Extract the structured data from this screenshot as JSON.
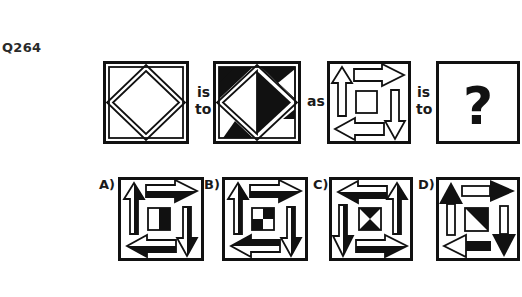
{
  "question": {
    "number": "Q264",
    "connectors": {
      "first_is": "is",
      "first_to": "to",
      "as": "as",
      "second_is": "is",
      "second_to": "to"
    },
    "figures": [
      {
        "id": "fig1",
        "description": "square frame with inscribed diamond, outlined, all white"
      },
      {
        "id": "fig2",
        "description": "square frame with inscribed diamond, left half white, right half black; corner triangles shaded black alternately"
      },
      {
        "id": "fig3",
        "description": "square frame with four outlined arrows circulating clockwise around a central square"
      },
      {
        "id": "fig4",
        "symbol": "?"
      }
    ],
    "options": [
      {
        "label": "A)",
        "description": "clockwise arrows, half-shaded arrows, center square right half black"
      },
      {
        "label": "B)",
        "description": "clockwise arrows, half-shaded arrows, center checkerboard"
      },
      {
        "label": "C)",
        "description": "counter-clockwise arrows, half-shaded, center hourglass triangles"
      },
      {
        "label": "D)",
        "description": "clockwise arrows with black heads, center square diagonal half black"
      }
    ]
  },
  "colors": {
    "ink": "#111111",
    "paper": "#ffffff"
  }
}
